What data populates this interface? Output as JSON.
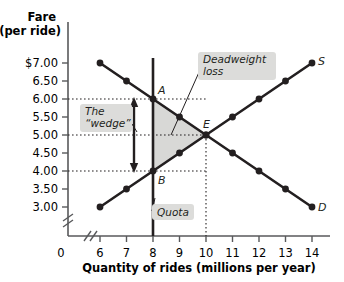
{
  "chart_data": {
    "type": "line",
    "title": "",
    "ylabel_line1": "Fare",
    "ylabel_line2": "(per ride)",
    "xlabel": "Quantity of rides (millions per year)",
    "origin_label": "0",
    "xlim": [
      5.4,
      14.8
    ],
    "ylim": [
      2.72,
      7.35
    ],
    "xticks": [
      6,
      7,
      8,
      9,
      10,
      11,
      12,
      13,
      14
    ],
    "xtick_labels": [
      "6",
      "7",
      "8",
      "9",
      "10",
      "11",
      "12",
      "13",
      "14"
    ],
    "yticks": [
      7.0,
      6.5,
      6.0,
      5.5,
      5.0,
      4.5,
      4.0,
      3.5,
      3.0
    ],
    "ytick_labels": [
      "$7.00",
      "6.50",
      "6.00",
      "5.50",
      "5.00",
      "4.50",
      "4.00",
      "3.50",
      "3.00"
    ],
    "axis_break_x": true,
    "axis_break_y": true,
    "grid": false,
    "series": [
      {
        "name": "D",
        "label": "D",
        "role": "demand",
        "x": [
          6,
          7,
          8,
          9,
          10,
          11,
          12,
          13,
          14
        ],
        "y": [
          7.0,
          6.5,
          6.0,
          5.5,
          5.0,
          4.5,
          4.0,
          3.5,
          3.0
        ]
      },
      {
        "name": "S",
        "label": "S",
        "role": "supply",
        "x": [
          6,
          7,
          8,
          9,
          10,
          11,
          12,
          13,
          14
        ],
        "y": [
          3.0,
          3.5,
          4.0,
          4.5,
          5.0,
          5.5,
          6.0,
          6.5,
          7.0
        ]
      }
    ],
    "quota_quantity": 8,
    "equilibrium": {
      "label": "E",
      "x": 10,
      "y": 5.0
    },
    "point_a": {
      "label": "A",
      "x": 8,
      "y": 6.0
    },
    "point_b": {
      "label": "B",
      "x": 8,
      "y": 4.0
    },
    "guide_lines": {
      "horizontal_y": [
        6.0,
        5.0,
        4.0
      ],
      "vertical_x": [
        10
      ]
    },
    "deadweight_triangle": {
      "vertices": [
        [
          8,
          6.0
        ],
        [
          10,
          5.0
        ],
        [
          8,
          4.0
        ]
      ]
    },
    "wedge_arrow": {
      "x": 8,
      "y_top": 6.0,
      "y_bottom": 4.0,
      "double_headed": true
    }
  },
  "annotations": {
    "deadweight_line1": "Deadweight",
    "deadweight_line2": "loss",
    "wedge_line1": "The",
    "wedge_line2": "“wedge”",
    "quota": "Quota"
  },
  "colors": {
    "curve": "#231f20",
    "axis": "#58595b",
    "shade": "#d8d8d6",
    "label_box": "#dcdcda",
    "background": "#ffffff"
  }
}
